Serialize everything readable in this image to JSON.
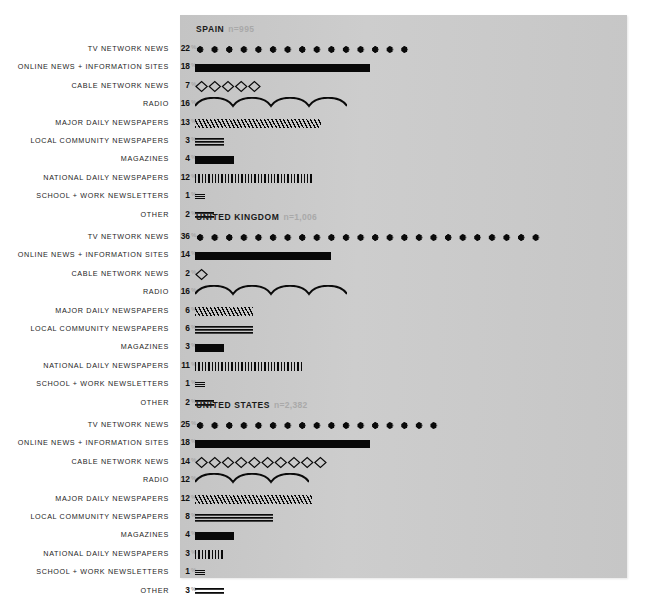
{
  "chart_data": {
    "type": "bar",
    "title": "",
    "subtitle": "",
    "xlabel": "",
    "ylabel": "",
    "grid": false,
    "legend_position": "none",
    "unit": "%",
    "axis_max": 36,
    "categories": [
      "TV NETWORK NEWS",
      "ONLINE NEWS + INFORMATION SITES",
      "CABLE NETWORK NEWS",
      "RADIO",
      "MAJOR DAILY NEWSPAPERS",
      "LOCAL COMMUNITY NEWSPAPERS",
      "MAGAZINES",
      "NATIONAL DAILY NEWSPAPERS",
      "SCHOOL + WORK NEWSLETTERS",
      "OTHER"
    ],
    "styles": [
      "dots",
      "solid",
      "diamonds",
      "wave",
      "hatch",
      "rules3",
      "block",
      "ticks",
      "rules3t",
      "rules2"
    ],
    "panels": [
      {
        "name": "SPAIN",
        "sample": "n=995",
        "values": [
          22,
          18,
          7,
          16,
          13,
          3,
          4,
          12,
          1,
          2
        ]
      },
      {
        "name": "UNITED KINGDOM",
        "sample": "n=1,006",
        "values": [
          36,
          14,
          2,
          16,
          6,
          6,
          3,
          11,
          1,
          2
        ]
      },
      {
        "name": "UNITED STATES",
        "sample": "n=2,382",
        "values": [
          25,
          18,
          14,
          12,
          12,
          8,
          4,
          3,
          1,
          3
        ]
      }
    ],
    "colors": {
      "panel_background": "#c9c9c9",
      "page_background": "#ffffff",
      "ink": "#0a0a0a",
      "sample_label": "#a9a9a9",
      "percent_symbol": "#a5a5a5"
    }
  }
}
